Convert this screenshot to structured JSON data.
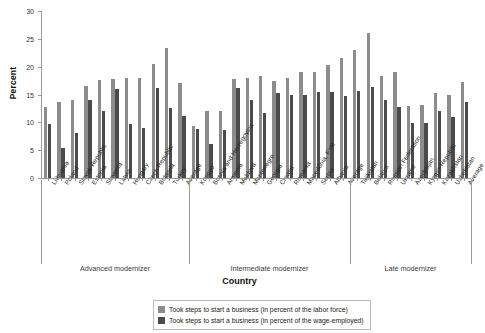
{
  "chart_data": {
    "type": "bar",
    "title": "",
    "xlabel": "Country",
    "ylabel": "Percent",
    "ylim": [
      0,
      30
    ],
    "yticks": [
      0,
      5,
      10,
      15,
      20,
      25,
      30
    ],
    "grid": false,
    "legend_position": "bottom",
    "colors": {
      "labor_force": "#8c8c8c",
      "wage_employed": "#4b4b4b",
      "axis": "#9a9a9a"
    },
    "categories": [
      "Lithuania",
      "Poland",
      "Slovak Republic",
      "Estonia",
      "Slovenia",
      "Latvia",
      "Hungary",
      "Czech Republic",
      "Bulgaria",
      "Turkey",
      "Average",
      "Kosovo",
      "Bosnia and Herzegovina",
      "Armenia",
      "Moldova",
      "Montenegro",
      "Georgia",
      "Croatia",
      "Romania",
      "Macedonia, FYR",
      "Serbia",
      "Albania",
      "Average",
      "Tajikistan",
      "Belarus",
      "Russian Federation",
      "Ukraine",
      "Azerbaijan",
      "Kyrgyz Republic",
      "Kazakhstan",
      "Uzbekistan",
      "Average"
    ],
    "series": [
      {
        "name": "Took steps to start a business (in percent of the labor force)",
        "key": "labor_force",
        "values": [
          12.7,
          13.6,
          14.0,
          16.6,
          17.6,
          17.8,
          18.0,
          18.0,
          20.5,
          23.3,
          17.0,
          9.4,
          12.0,
          12.0,
          17.8,
          17.9,
          18.4,
          17.5,
          17.9,
          19.0,
          19.1,
          20.3,
          21.6,
          23.0,
          26.0,
          18.3,
          19.1,
          13.0,
          13.1,
          15.2,
          15.0,
          17.3
        ]
      },
      {
        "name": "Took steps to start a business (in percent of the wage-employed)",
        "key": "wage_employed",
        "values": [
          9.7,
          5.4,
          8.0,
          14.1,
          12.1,
          16.0,
          9.7,
          8.9,
          16.1,
          12.5,
          11.1,
          8.8,
          6.1,
          8.6,
          16.2,
          14.1,
          11.6,
          15.2,
          14.9,
          15.0,
          15.5,
          15.4,
          14.8,
          15.7,
          16.4,
          14.1,
          12.8,
          9.8,
          9.9,
          12.1,
          11.0,
          13.6
        ]
      }
    ],
    "groups": [
      {
        "label": "Advanced modernizer",
        "start": 0,
        "end": 10
      },
      {
        "label": "Intermediate modernizer",
        "start": 11,
        "end": 22
      },
      {
        "label": "Late modernizer",
        "start": 23,
        "end": 31
      }
    ]
  }
}
